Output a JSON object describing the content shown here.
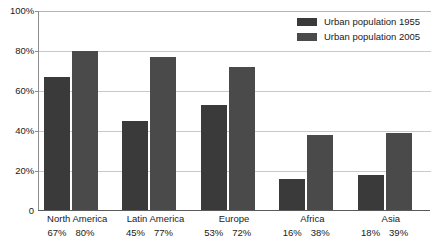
{
  "chart_data": {
    "type": "bar",
    "title": "",
    "xlabel": "",
    "ylabel": "",
    "ylim": [
      0,
      100
    ],
    "grid": true,
    "legend_position": "top-right",
    "categories": [
      "North America",
      "Latin America",
      "Europe",
      "Africa",
      "Asia"
    ],
    "series": [
      {
        "name": "Urban population 1955",
        "color": "#3a3a3a",
        "values": [
          67,
          45,
          53,
          16,
          18
        ]
      },
      {
        "name": "Urban population 2005",
        "color": "#4a4a4a",
        "values": [
          80,
          77,
          72,
          38,
          39
        ]
      }
    ],
    "y_ticks": [
      {
        "value": 0,
        "label": "0"
      },
      {
        "value": 20,
        "label": "20%"
      },
      {
        "value": 40,
        "label": "40%"
      },
      {
        "value": 60,
        "label": "60%"
      },
      {
        "value": 80,
        "label": "80%"
      },
      {
        "value": 100,
        "label": "100%"
      }
    ],
    "data_labels": [
      {
        "category": "North America",
        "labels": [
          "67%",
          "80%"
        ]
      },
      {
        "category": "Latin America",
        "labels": [
          "45%",
          "77%"
        ]
      },
      {
        "category": "Europe",
        "labels": [
          "53%",
          "72%"
        ]
      },
      {
        "category": "Africa",
        "labels": [
          "16%",
          "38%"
        ]
      },
      {
        "category": "Asia",
        "labels": [
          "18%",
          "39%"
        ]
      }
    ]
  }
}
